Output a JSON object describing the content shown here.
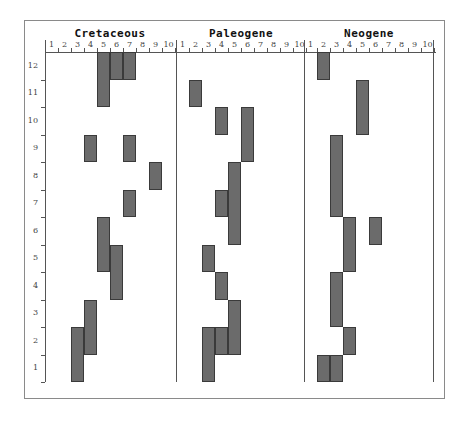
{
  "chart_data": {
    "type": "heatmap",
    "title": "",
    "panels": [
      "Cretaceous",
      "Paleogene",
      "Neogene"
    ],
    "x_ticks": [
      "1",
      "2",
      "3",
      "4",
      "5",
      "6",
      "7",
      "8",
      "9",
      "10"
    ],
    "y_ticks": [
      "1",
      "2",
      "3",
      "4",
      "5",
      "6",
      "7",
      "8",
      "9",
      "10",
      "11",
      "12"
    ],
    "xlim": [
      1,
      10
    ],
    "ylim": [
      1,
      12
    ],
    "bar_color": "#6b6b6b",
    "cells": {
      "Cretaceous": [
        {
          "x": 5,
          "y_from": 11,
          "y_to": 12
        },
        {
          "x": 6,
          "y_from": 12,
          "y_to": 12
        },
        {
          "x": 7,
          "y_from": 12,
          "y_to": 12
        },
        {
          "x": 4,
          "y_from": 9,
          "y_to": 9
        },
        {
          "x": 7,
          "y_from": 9,
          "y_to": 9
        },
        {
          "x": 9,
          "y_from": 8,
          "y_to": 8
        },
        {
          "x": 7,
          "y_from": 7,
          "y_to": 7
        },
        {
          "x": 5,
          "y_from": 5,
          "y_to": 6
        },
        {
          "x": 6,
          "y_from": 4,
          "y_to": 5
        },
        {
          "x": 4,
          "y_from": 2,
          "y_to": 3
        },
        {
          "x": 3,
          "y_from": 1,
          "y_to": 2
        }
      ],
      "Paleogene": [
        {
          "x": 2,
          "y_from": 11,
          "y_to": 11
        },
        {
          "x": 4,
          "y_from": 10,
          "y_to": 10
        },
        {
          "x": 6,
          "y_from": 9,
          "y_to": 10
        },
        {
          "x": 5,
          "y_from": 6,
          "y_to": 8
        },
        {
          "x": 4,
          "y_from": 7,
          "y_to": 7
        },
        {
          "x": 3,
          "y_from": 5,
          "y_to": 5
        },
        {
          "x": 4,
          "y_from": 4,
          "y_to": 4
        },
        {
          "x": 5,
          "y_from": 2,
          "y_to": 3
        },
        {
          "x": 4,
          "y_from": 2,
          "y_to": 2
        },
        {
          "x": 3,
          "y_from": 1,
          "y_to": 2
        }
      ],
      "Neogene": [
        {
          "x": 2,
          "y_from": 12,
          "y_to": 12
        },
        {
          "x": 5,
          "y_from": 10,
          "y_to": 11
        },
        {
          "x": 3,
          "y_from": 7,
          "y_to": 9
        },
        {
          "x": 4,
          "y_from": 5,
          "y_to": 6
        },
        {
          "x": 6,
          "y_from": 6,
          "y_to": 6
        },
        {
          "x": 3,
          "y_from": 3,
          "y_to": 4
        },
        {
          "x": 4,
          "y_from": 2,
          "y_to": 2
        },
        {
          "x": 2,
          "y_from": 1,
          "y_to": 1
        },
        {
          "x": 3,
          "y_from": 1,
          "y_to": 1
        }
      ]
    }
  }
}
